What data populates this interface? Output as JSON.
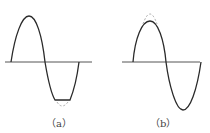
{
  "figures": [
    {
      "id": "a",
      "label": "（a）",
      "description": "sine wave with clipped negative half-cycle (dashed original trough)"
    },
    {
      "id": "b",
      "label": "（b）",
      "description": "sine wave with compressed positive peak (dashed original peak)"
    }
  ],
  "colors": {
    "curve": "#2a2a2a",
    "axis": "#555555",
    "dashed": "#aaaaaa"
  }
}
